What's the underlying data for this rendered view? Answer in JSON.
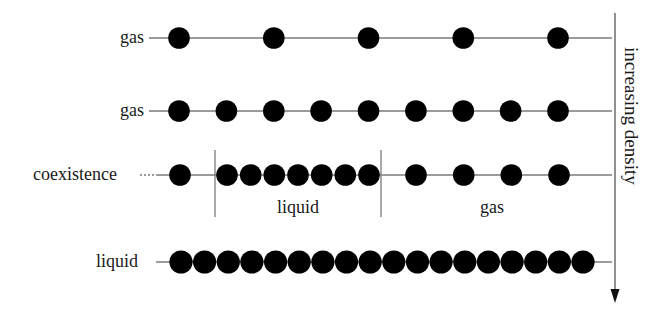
{
  "figure": {
    "title": "",
    "axis": {
      "label": "increasing density",
      "direction": "down"
    },
    "rows": [
      {
        "label": "gas",
        "phase": "gas",
        "particle_count": 5
      },
      {
        "label": "gas",
        "phase": "gas",
        "particle_count": 9
      },
      {
        "label": "coexistence",
        "phase": "coexistence",
        "particle_count": 12,
        "regions": [
          {
            "label": "liquid",
            "particle_count": 7
          },
          {
            "label": "gas",
            "particle_count": 4
          }
        ]
      },
      {
        "label": "liquid",
        "phase": "liquid",
        "particle_count": 18
      }
    ]
  },
  "colors": {
    "particle": "#000000",
    "line": "#7a7a7a",
    "text": "#1a1a1a"
  }
}
